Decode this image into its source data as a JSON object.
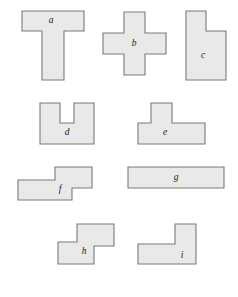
{
  "figure": {
    "background_color": "#ffffff",
    "width": 238,
    "height": 297,
    "shape_fill": "#e9e9e7",
    "shape_stroke": "#7a7a7a",
    "shapes": [
      {
        "id": "a",
        "label": "a",
        "name": "t-shape",
        "row": 1,
        "points": "22,11 84,11 84,31 64,31 64,80 42,80 42,31 22,31",
        "label_x": 51,
        "label_y": 21
      },
      {
        "id": "b",
        "label": "b",
        "name": "plus-cross-shape",
        "row": 1,
        "points": "124,12 145,12 145,33 166,33 166,54 145,54 145,75 124,75 124,54 103,54 103,33 124,33",
        "label_x": 134,
        "label_y": 44
      },
      {
        "id": "c",
        "label": "c",
        "name": "notched-l-shape",
        "row": 1,
        "points": "186,11 206,11 206,31 226,31 226,80 186,80",
        "label_x": 203,
        "label_y": 56
      },
      {
        "id": "d",
        "label": "d",
        "name": "u-shape",
        "row": 2,
        "points": "40,103 60,103 60,123 74,123 74,103 94,103 94,144 40,144",
        "label_x": 67,
        "label_y": 133
      },
      {
        "id": "e",
        "label": "e",
        "name": "inverted-t-shape",
        "row": 2,
        "points": "151,103 172,103 172,123 205,123 205,144 138,144 138,123 151,123",
        "label_x": 165,
        "label_y": 133
      },
      {
        "id": "f",
        "label": "f",
        "name": "s-z-step-shape",
        "row": 3,
        "points": "55,167 92,167 92,188 72,188 72,200 18,200 18,180 55,180",
        "label_x": 60,
        "label_y": 190
      },
      {
        "id": "g",
        "label": "g",
        "name": "wide-rectangle-shape",
        "row": 3,
        "points": "128,167 224,167 224,188 128,188",
        "label_x": 176,
        "label_y": 178
      },
      {
        "id": "h",
        "label": "h",
        "name": "s-z-vertical-shape",
        "row": 4,
        "points": "77,224 114,224 114,246 94,246 94,264 58,264 58,242 77,242",
        "label_x": 84,
        "label_y": 252
      },
      {
        "id": "i",
        "label": "i",
        "name": "l-corner-shape",
        "row": 4,
        "points": "175,224 196,224 196,264 138,264 138,244 175,244",
        "label_x": 182,
        "label_y": 256
      }
    ]
  }
}
